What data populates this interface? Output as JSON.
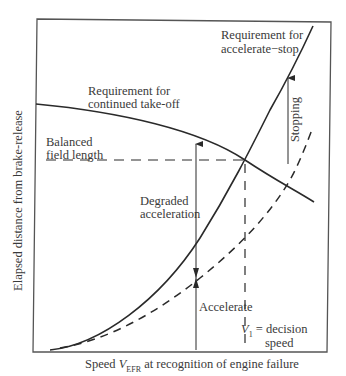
{
  "diagram": {
    "y_axis_label": "Elapsed distance from brake-release",
    "x_axis_label_prefix": "Speed ",
    "x_axis_label_var": "V",
    "x_axis_label_sub": "EFR",
    "x_axis_label_suffix": " at recognition of engine failure",
    "labels": {
      "accel_stop_line1": "Requirement for",
      "accel_stop_line2": "accelerate−stop",
      "continued_line1": "Requirement for",
      "continued_line2": "continued take-off",
      "balanced_line1": "Balanced",
      "balanced_line2": "field length",
      "degraded_line1": "Degraded",
      "degraded_line2": "acceleration",
      "accelerate": "Accelerate",
      "stopping": "Stopping",
      "v1_var": "V",
      "v1_sub": "1",
      "v1_eq": " = decision",
      "v1_line2": "speed"
    },
    "colors": {
      "line": "#2a2a2a",
      "axis": "#555555"
    }
  }
}
